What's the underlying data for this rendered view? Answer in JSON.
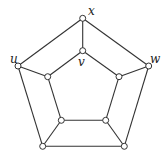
{
  "diagram": {
    "type": "graph",
    "vertices": [
      {
        "id": "x",
        "label": "x",
        "ring": "outer",
        "position": "top"
      },
      {
        "id": "w",
        "label": "w",
        "ring": "outer",
        "position": "right"
      },
      {
        "id": "o3",
        "label": "",
        "ring": "outer",
        "position": "bottom-right"
      },
      {
        "id": "o4",
        "label": "",
        "ring": "outer",
        "position": "bottom-left"
      },
      {
        "id": "u",
        "label": "u",
        "ring": "outer",
        "position": "left"
      },
      {
        "id": "v",
        "label": "v",
        "ring": "inner",
        "position": "top"
      },
      {
        "id": "i2",
        "label": "",
        "ring": "inner",
        "position": "right"
      },
      {
        "id": "i3",
        "label": "",
        "ring": "inner",
        "position": "bottom-right"
      },
      {
        "id": "i4",
        "label": "",
        "ring": "inner",
        "position": "bottom-left"
      },
      {
        "id": "i5",
        "label": "",
        "ring": "inner",
        "position": "left"
      }
    ],
    "edges": [
      [
        "x",
        "w"
      ],
      [
        "w",
        "o3"
      ],
      [
        "o3",
        "o4"
      ],
      [
        "o4",
        "u"
      ],
      [
        "u",
        "x"
      ],
      [
        "v",
        "i2"
      ],
      [
        "i2",
        "i3"
      ],
      [
        "i3",
        "i4"
      ],
      [
        "i4",
        "i5"
      ],
      [
        "i5",
        "v"
      ],
      [
        "x",
        "v"
      ],
      [
        "w",
        "i2"
      ],
      [
        "o3",
        "i3"
      ],
      [
        "o4",
        "i4"
      ],
      [
        "u",
        "i5"
      ]
    ],
    "labels": {
      "x": "x",
      "v": "v",
      "u": "u",
      "w": "w"
    }
  }
}
